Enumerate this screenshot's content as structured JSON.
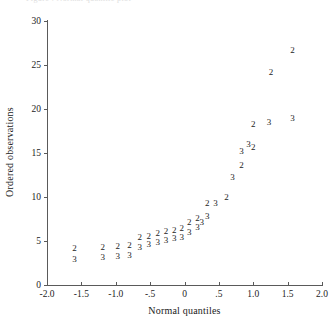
{
  "figure": {
    "top_cut_text": "Figure  .   Normal quantile plot"
  },
  "axis": {
    "x_title": "Normal quantiles",
    "y_title": "Ordered observations",
    "x_ticks": [
      "-2.0",
      "-1.5",
      "-1.0",
      "-.5",
      "0",
      ".5",
      "1.0",
      "1.5",
      "2.0"
    ],
    "x_tick_values": [
      -2.0,
      -1.5,
      -1.0,
      -0.5,
      0,
      0.5,
      1.0,
      1.5,
      2.0
    ],
    "y_ticks": [
      "0",
      "5",
      "10",
      "15",
      "20",
      "25",
      "30"
    ],
    "y_tick_values": [
      0,
      5,
      10,
      15,
      20,
      25,
      30
    ]
  },
  "chart_data": {
    "type": "scatter",
    "title": "",
    "xlabel": "Normal quantiles",
    "ylabel": "Ordered observations",
    "xlim": [
      -2.0,
      2.0
    ],
    "ylim": [
      0,
      30
    ],
    "grid": false,
    "legend": "none",
    "marker_style": "group-digit-glyph",
    "annotation": "Each plotted point is drawn as the digit of its group label (2 or 3) rather than a symbol.",
    "series": [
      {
        "name": "2",
        "label_glyph": "2",
        "points": [
          {
            "x": -1.6,
            "y": 4.2
          },
          {
            "x": -1.19,
            "y": 4.3
          },
          {
            "x": -0.97,
            "y": 4.4
          },
          {
            "x": -0.8,
            "y": 4.5
          },
          {
            "x": -0.65,
            "y": 5.5
          },
          {
            "x": -0.52,
            "y": 5.6
          },
          {
            "x": -0.39,
            "y": 5.9
          },
          {
            "x": -0.27,
            "y": 6.1
          },
          {
            "x": -0.15,
            "y": 6.2
          },
          {
            "x": -0.04,
            "y": 6.5
          },
          {
            "x": 0.07,
            "y": 7.1
          },
          {
            "x": 0.19,
            "y": 7.6
          },
          {
            "x": 0.33,
            "y": 9.3
          },
          {
            "x": 0.61,
            "y": 10.0
          },
          {
            "x": 0.83,
            "y": 13.6
          },
          {
            "x": 1.0,
            "y": 15.7
          },
          {
            "x": 1.0,
            "y": 18.3
          },
          {
            "x": 1.26,
            "y": 24.2
          },
          {
            "x": 1.57,
            "y": 26.7
          }
        ]
      },
      {
        "name": "3",
        "label_glyph": "3",
        "points": [
          {
            "x": -1.6,
            "y": 3.0
          },
          {
            "x": -1.19,
            "y": 3.2
          },
          {
            "x": -0.97,
            "y": 3.3
          },
          {
            "x": -0.8,
            "y": 3.4
          },
          {
            "x": -0.65,
            "y": 4.3
          },
          {
            "x": -0.52,
            "y": 4.7
          },
          {
            "x": -0.39,
            "y": 4.9
          },
          {
            "x": -0.27,
            "y": 5.1
          },
          {
            "x": -0.15,
            "y": 5.3
          },
          {
            "x": -0.04,
            "y": 5.5
          },
          {
            "x": 0.07,
            "y": 6.0
          },
          {
            "x": 0.19,
            "y": 6.6
          },
          {
            "x": 0.25,
            "y": 7.2
          },
          {
            "x": 0.33,
            "y": 7.8
          },
          {
            "x": 0.45,
            "y": 9.3
          },
          {
            "x": 0.7,
            "y": 12.2
          },
          {
            "x": 0.83,
            "y": 15.2
          },
          {
            "x": 0.93,
            "y": 16.0
          },
          {
            "x": 1.23,
            "y": 18.5
          },
          {
            "x": 1.57,
            "y": 19.0
          }
        ]
      }
    ]
  }
}
